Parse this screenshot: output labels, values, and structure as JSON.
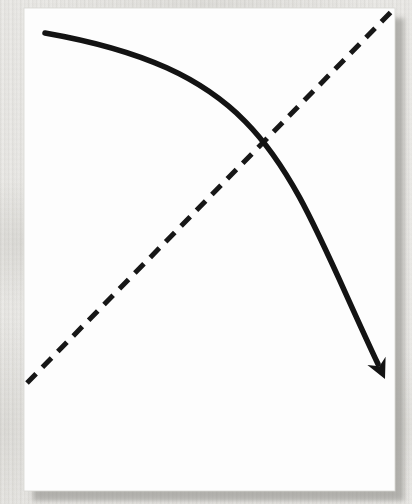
{
  "image": {
    "width": 412,
    "height": 504,
    "description": "origami-fold-step-diagram"
  },
  "background": {
    "color": "#eae9e6",
    "texture_name": "woven-fabric-texture"
  },
  "paper": {
    "x": 24,
    "y": 8,
    "width": 371,
    "height": 483,
    "fill": "#fdfdfd",
    "edge_color": "#d8d7d3",
    "shadow": {
      "x": 33,
      "y": 18,
      "color": "#8f8e89",
      "opacity": 0.6
    }
  },
  "fold_line": {
    "name": "diagonal-valley-fold-line",
    "x1": 27,
    "y1": 383,
    "x2": 393,
    "y2": 10,
    "color": "#171717",
    "stroke_width": 5,
    "dash": "13 9"
  },
  "arrow": {
    "name": "fold-direction-arrow",
    "color": "#131313",
    "stroke_width": 5.5,
    "shaft_path": "M 45 33 C 272 73, 286 169, 378 364",
    "head_path": "M 385 379 L 385.6 356.7 L 379.5 366.2 L 367.4 365.1 Z"
  }
}
